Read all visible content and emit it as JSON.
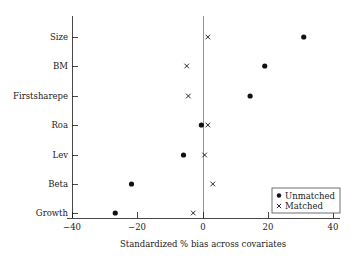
{
  "chart_data": {
    "type": "scatter",
    "title": "",
    "xlabel": "Standardized % bias across covariates",
    "ylabel": "",
    "xlim": [
      -45,
      45
    ],
    "xticks": [
      -40,
      -20,
      0,
      20,
      40
    ],
    "xtick_labels": [
      "−40",
      "−20",
      "0",
      "20",
      "40"
    ],
    "grid": false,
    "zero_reference_line": 0,
    "legend_position": "bottom-right",
    "categories": [
      "Size",
      "BM",
      "Firstsharepe",
      "Roa",
      "Lev",
      "Beta",
      "Growth"
    ],
    "series": [
      {
        "name": "Unmatched",
        "marker": "filled-circle",
        "color": "#111111",
        "values": [
          31,
          19,
          14.5,
          -0.5,
          -6,
          -22,
          -27
        ]
      },
      {
        "name": "Matched",
        "marker": "cross",
        "color": "#111111",
        "values": [
          1.5,
          -5,
          -4.5,
          1.5,
          0.5,
          3,
          -3
        ]
      }
    ]
  },
  "legend": {
    "entries": [
      {
        "label": "Unmatched",
        "marker": "filled-circle"
      },
      {
        "label": "Matched",
        "marker": "cross"
      }
    ]
  },
  "axes": {
    "x_title": "Standardized % bias across covariates",
    "x_tick_labels": [
      "−40",
      "−20",
      "0",
      "20",
      "40"
    ],
    "y_tick_labels": [
      "Size",
      "BM",
      "Firstsharepe",
      "Roa",
      "Lev",
      "Beta",
      "Growth"
    ]
  }
}
